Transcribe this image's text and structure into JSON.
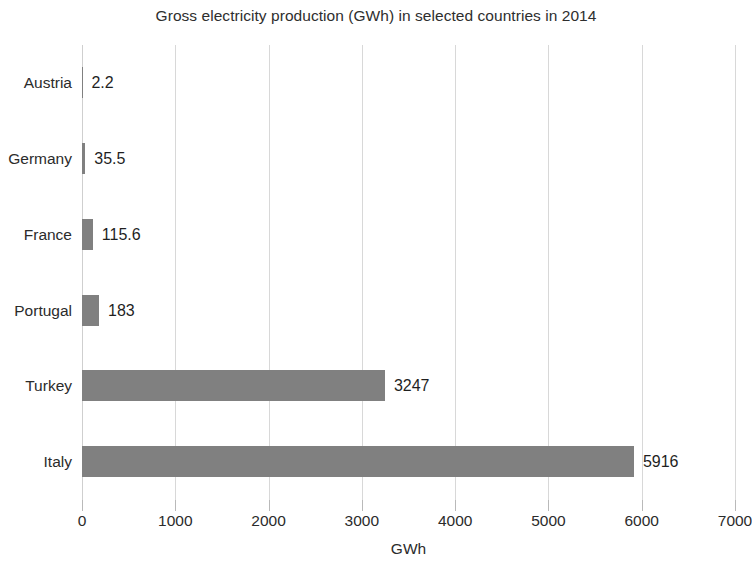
{
  "chart_data": {
    "type": "bar",
    "orientation": "horizontal",
    "title": "Gross electricity production (GWh) in selected countries in 2014",
    "xlabel": "GWh",
    "ylabel": "",
    "categories": [
      "Austria",
      "Germany",
      "France",
      "Portugal",
      "Turkey",
      "Italy"
    ],
    "values": [
      2.2,
      35.5,
      115.6,
      183,
      3247,
      5916
    ],
    "value_labels": [
      "2.2",
      "35.5",
      "115.6",
      "183",
      "3247",
      "5916"
    ],
    "xlim": [
      0,
      7000
    ],
    "xticks": [
      0,
      1000,
      2000,
      3000,
      4000,
      5000,
      6000,
      7000
    ],
    "xtick_labels": [
      "0",
      "1000",
      "2000",
      "3000",
      "4000",
      "5000",
      "6000",
      "7000"
    ],
    "grid": true,
    "grid_axis": "x",
    "legend": null,
    "bar_color": "#808080",
    "grid_color": "#d8d8d8",
    "background_color": "#ffffff",
    "text_color": "#2b2b2b"
  }
}
